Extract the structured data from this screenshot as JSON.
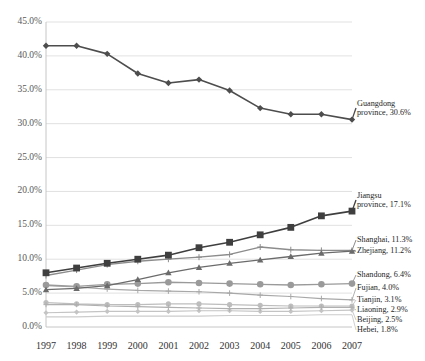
{
  "chart_data": {
    "type": "line",
    "title": "",
    "xlabel": "",
    "ylabel": "",
    "x": [
      1997,
      1998,
      1999,
      2000,
      2001,
      2002,
      2003,
      2004,
      2005,
      2006,
      2007
    ],
    "xticklabels": [
      "1997",
      "1998",
      "1999",
      "2000",
      "2001",
      "2002",
      "2003",
      "2004",
      "2005",
      "2006",
      "2007"
    ],
    "yticklabels": [
      "0.0%",
      "5.0%",
      "10.0%",
      "15.0%",
      "20.0%",
      "25.0%",
      "30.0%",
      "35.0%",
      "40.0%",
      "45.0%"
    ],
    "ylim": [
      0,
      45
    ],
    "ytickvalues": [
      0,
      5,
      10,
      15,
      20,
      25,
      30,
      35,
      40,
      45
    ],
    "grid": "horizontal",
    "legend_position": "right-inline-annotations",
    "series": [
      {
        "name": "Guangdong",
        "annotation": "Guangdong province, 30.6%",
        "annotation_line1": "Guangdong",
        "annotation_line2": "province, 30.6%",
        "marker": "diamond",
        "color": "#4d4d4d",
        "width": 1.6,
        "markersize": 3.2,
        "values": [
          41.5,
          41.5,
          40.3,
          37.4,
          36.0,
          36.5,
          34.9,
          32.3,
          31.4,
          31.4,
          30.6
        ]
      },
      {
        "name": "Jiangsu",
        "annotation": "Jiangsu province, 17.1%",
        "annotation_line1": "Jiangsu",
        "annotation_line2": "province, 17.1%",
        "marker": "square",
        "color": "#3f3f3f",
        "width": 1.6,
        "markersize": 3.4,
        "values": [
          8.0,
          8.7,
          9.4,
          10.0,
          10.6,
          11.7,
          12.5,
          13.6,
          14.7,
          16.4,
          17.1
        ]
      },
      {
        "name": "Shanghai",
        "annotation": "Shanghai, 11.3%",
        "annotation_line1": "Shanghai, 11.3%",
        "annotation_line2": "",
        "marker": "cross",
        "color": "#8c8c8c",
        "width": 1.3,
        "markersize": 3.0,
        "values": [
          7.6,
          8.4,
          9.2,
          9.7,
          10.0,
          10.3,
          10.7,
          11.8,
          11.4,
          11.3,
          11.3
        ]
      },
      {
        "name": "Zhejiang",
        "annotation": "Zhejiang, 11.2%",
        "annotation_line1": "Zhejiang, 11.2%",
        "annotation_line2": "",
        "marker": "triangle",
        "color": "#6b6b6b",
        "width": 1.3,
        "markersize": 3.2,
        "values": [
          5.5,
          5.7,
          6.1,
          7.0,
          8.0,
          8.8,
          9.4,
          9.9,
          10.4,
          10.9,
          11.2
        ]
      },
      {
        "name": "Shandong",
        "annotation": "Shandong, 6.4%",
        "annotation_line1": "Shandong, 6.4%",
        "annotation_line2": "",
        "marker": "circle",
        "color": "#9a9a9a",
        "width": 1.3,
        "markersize": 3.3,
        "values": [
          6.2,
          6.0,
          6.3,
          6.4,
          6.6,
          6.5,
          6.4,
          6.3,
          6.2,
          6.3,
          6.4
        ]
      },
      {
        "name": "Fujian",
        "annotation": "Fujian, 4.0%",
        "annotation_line1": "Fujian, 4.0%",
        "annotation_line2": "",
        "marker": "cross",
        "color": "#a8a8a8",
        "width": 1.2,
        "markersize": 2.8,
        "values": [
          6.1,
          5.9,
          5.6,
          5.4,
          5.3,
          5.2,
          5.0,
          4.7,
          4.5,
          4.2,
          4.0
        ]
      },
      {
        "name": "Tianjin",
        "annotation": "Tianjin, 3.1%",
        "annotation_line1": "Tianjin, 3.1%",
        "annotation_line2": "",
        "marker": "circle",
        "color": "#bdbdbd",
        "width": 1.2,
        "markersize": 2.6,
        "values": [
          3.6,
          3.4,
          3.3,
          3.3,
          3.4,
          3.4,
          3.3,
          3.2,
          3.1,
          3.1,
          3.1
        ]
      },
      {
        "name": "Liaoning",
        "annotation": "Liaoning, 2.9%",
        "annotation_line1": "Liaoning, 2.9%",
        "annotation_line2": "",
        "marker": "cross",
        "color": "#b0b0b0",
        "width": 1.2,
        "markersize": 2.6,
        "values": [
          3.3,
          3.3,
          3.1,
          3.0,
          2.9,
          2.8,
          2.7,
          2.7,
          2.8,
          2.9,
          2.9
        ]
      },
      {
        "name": "Beijing",
        "annotation": "Beijing, 2.5%",
        "annotation_line1": "Beijing, 2.5%",
        "annotation_line2": "",
        "marker": "diamond",
        "color": "#c4c4c4",
        "width": 1.2,
        "markersize": 2.6,
        "values": [
          2.1,
          2.2,
          2.3,
          2.3,
          2.3,
          2.4,
          2.4,
          2.3,
          2.3,
          2.4,
          2.5
        ]
      },
      {
        "name": "Hebei",
        "annotation": "Hebei, 1.8%",
        "annotation_line1": "Hebei, 1.8%",
        "annotation_line2": "",
        "marker": "none",
        "color": "#cccccc",
        "width": 1.1,
        "markersize": 0,
        "values": [
          1.5,
          1.5,
          1.6,
          1.6,
          1.6,
          1.6,
          1.7,
          1.7,
          1.7,
          1.8,
          1.8
        ]
      }
    ]
  }
}
